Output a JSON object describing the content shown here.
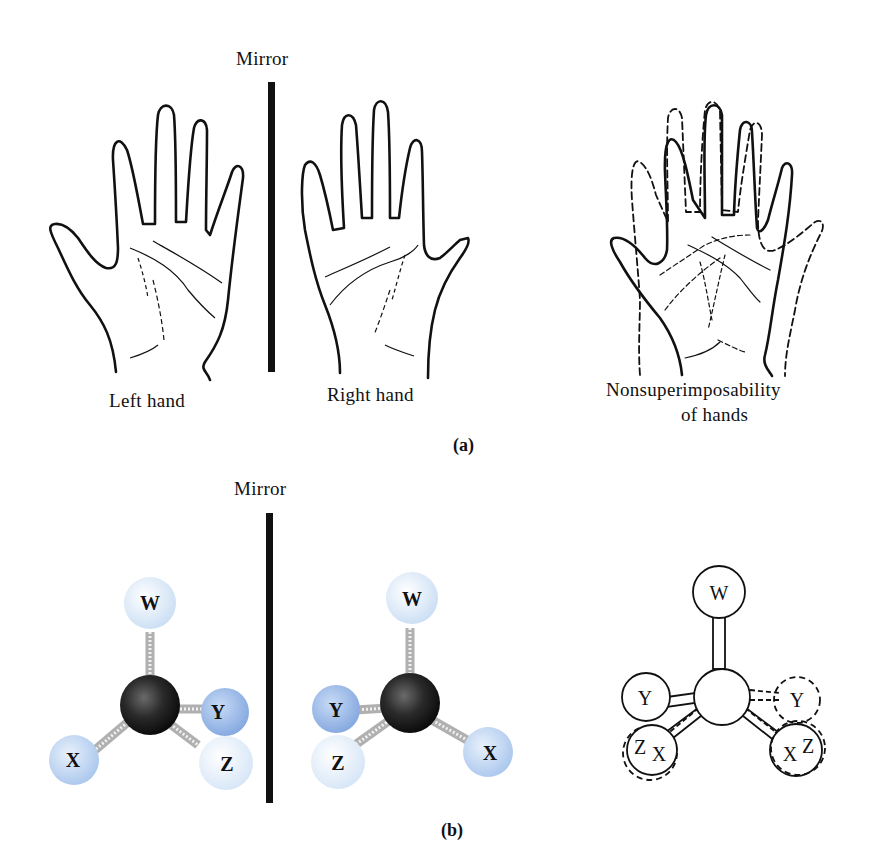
{
  "panel_a": {
    "mirror_label": "Mirror",
    "left_label": "Left hand",
    "right_label": "Right hand",
    "overlay_label_line1": "Nonsuperimposability",
    "overlay_label_line2": "of hands",
    "panel_tag": "(a)"
  },
  "panel_b": {
    "mirror_label": "Mirror",
    "panel_tag": "(b)",
    "left_molecule": {
      "atoms": [
        {
          "label": "W",
          "color": "#dceaf7"
        },
        {
          "label": "X",
          "color": "#b9d2f0"
        },
        {
          "label": "Y",
          "color": "#9dbbe8"
        },
        {
          "label": "Z",
          "color": "#e3eef9"
        }
      ],
      "center_color": "#1c1c1c"
    },
    "right_molecule": {
      "atoms": [
        {
          "label": "W",
          "color": "#dceaf7"
        },
        {
          "label": "Y",
          "color": "#9dbbe8"
        },
        {
          "label": "Z",
          "color": "#e3eef9"
        },
        {
          "label": "X",
          "color": "#b9d2f0"
        }
      ],
      "center_color": "#1c1c1c"
    },
    "overlay_molecule": {
      "atoms": [
        "W",
        "Y",
        "Y",
        "Z",
        "X",
        "X",
        "Z"
      ]
    }
  }
}
